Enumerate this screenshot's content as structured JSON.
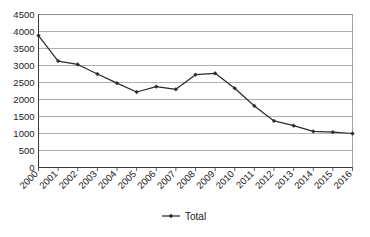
{
  "chart_data": {
    "type": "line",
    "title": "",
    "subtitle": "",
    "xlabel": "",
    "ylabel": "",
    "categories": [
      "2000",
      "2001",
      "2002",
      "2003",
      "2004",
      "2005",
      "2006",
      "2007",
      "2008",
      "2009",
      "2010",
      "2011",
      "2012",
      "2013",
      "2014",
      "2015",
      "2016"
    ],
    "series": [
      {
        "name": "Total",
        "values": [
          3880,
          3130,
          3030,
          2750,
          2480,
          2220,
          2380,
          2300,
          2730,
          2770,
          2330,
          1810,
          1370,
          1230,
          1060,
          1040,
          1000
        ]
      }
    ],
    "ylim": [
      0,
      4500
    ],
    "ytick_values": [
      0,
      500,
      1000,
      1500,
      2000,
      2500,
      3000,
      3500,
      4000,
      4500
    ],
    "ytick_labels": [
      "0",
      "500",
      "1000",
      "1500",
      "2000",
      "2500",
      "3000",
      "3500",
      "4000",
      "4500"
    ],
    "grid": true,
    "grid_axis": "y",
    "legend": {
      "position": "bottom",
      "entries": [
        {
          "label": "Total",
          "marker": "diamond",
          "color": "#2b2b2b"
        }
      ]
    },
    "xtick_rotation": -45,
    "colors": {
      "series": "#2b2b2b",
      "gridline": "#8c8c8c",
      "axis": "#3a3a3a",
      "background": "#ffffff",
      "text": "#1a1a1a"
    }
  }
}
